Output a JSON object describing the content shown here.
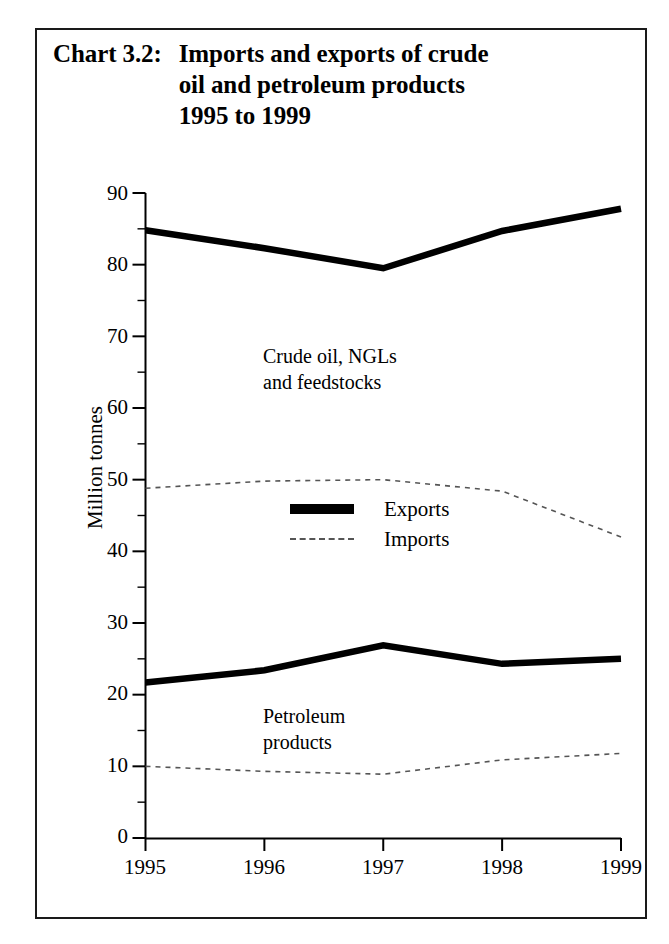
{
  "title": {
    "label": "Chart 3.2:",
    "lines": [
      "Imports and exports of crude",
      "oil and petroleum products",
      "1995 to 1999"
    ]
  },
  "axes": {
    "ylabel": "Million tonnes",
    "yticks": [
      "90",
      "80",
      "70",
      "60",
      "50",
      "40",
      "30",
      "20",
      "10",
      "0"
    ],
    "xticks": [
      "1995",
      "1996",
      "1997",
      "1998",
      "1999"
    ]
  },
  "legend": {
    "items": [
      {
        "label": "Exports",
        "style": "solid-thick",
        "color": "#000000"
      },
      {
        "label": "Imports",
        "style": "dashed-thin",
        "color": "#555555"
      }
    ]
  },
  "annotations": [
    {
      "lines": [
        "Crude oil, NGLs",
        "and feedstocks"
      ]
    },
    {
      "lines": [
        "Petroleum",
        "products"
      ]
    }
  ],
  "chart_data": {
    "type": "line",
    "title": "Chart 3.2: Imports and exports of crude oil and petroleum products 1995 to 1999",
    "xlabel": "",
    "ylabel": "Million tonnes",
    "x": [
      "1995",
      "1996",
      "1997",
      "1998",
      "1999"
    ],
    "xlim": [
      "1995",
      "1999"
    ],
    "ylim": [
      0,
      90
    ],
    "ytick_step": 10,
    "yminor_tick_step": 5,
    "grid": false,
    "legend_position": "center",
    "series": [
      {
        "name": "Crude oil, NGLs and feedstocks - Exports",
        "group": "Crude oil, NGLs and feedstocks",
        "flow": "Exports",
        "style": "solid-thick",
        "color": "#000000",
        "values": [
          84.8,
          82.3,
          79.5,
          84.7,
          87.8
        ]
      },
      {
        "name": "Crude oil, NGLs and feedstocks - Imports",
        "group": "Crude oil, NGLs and feedstocks",
        "flow": "Imports",
        "style": "dashed-thin",
        "color": "#555555",
        "values": [
          48.8,
          49.8,
          50.0,
          48.4,
          42.0
        ]
      },
      {
        "name": "Petroleum products - Exports",
        "group": "Petroleum products",
        "flow": "Exports",
        "style": "solid-thick",
        "color": "#000000",
        "values": [
          21.7,
          23.4,
          26.9,
          24.3,
          25.0
        ]
      },
      {
        "name": "Petroleum products - Imports",
        "group": "Petroleum products",
        "flow": "Imports",
        "style": "dashed-thin",
        "color": "#555555",
        "values": [
          10.0,
          9.3,
          8.9,
          10.9,
          11.8
        ]
      }
    ]
  }
}
